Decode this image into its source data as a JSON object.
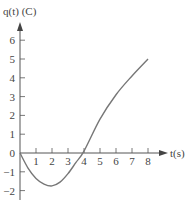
{
  "chart_data": {
    "type": "line",
    "title": "",
    "xlabel": "t(s)",
    "ylabel": "q(t) (C)",
    "xlim": [
      0,
      8
    ],
    "ylim": [
      -2,
      6
    ],
    "x_ticks": [
      "1",
      "2",
      "3",
      "4",
      "5",
      "6",
      "7",
      "8"
    ],
    "y_ticks": [
      "6",
      "5",
      "4",
      "3",
      "2",
      "1",
      "0",
      "-1",
      "-2"
    ],
    "grid": false,
    "series": [
      {
        "name": "q(t)",
        "x": [
          0,
          0.5,
          1,
          1.5,
          2,
          2.5,
          3,
          3.5,
          4,
          5,
          6,
          7,
          8
        ],
        "y": [
          0,
          -0.8,
          -1.35,
          -1.65,
          -1.75,
          -1.55,
          -1.1,
          -0.5,
          0.1,
          1.8,
          3.1,
          4.1,
          5.0
        ]
      }
    ],
    "colors": {
      "curve": "#777777",
      "axis": "#555555",
      "text": "#444444"
    }
  }
}
